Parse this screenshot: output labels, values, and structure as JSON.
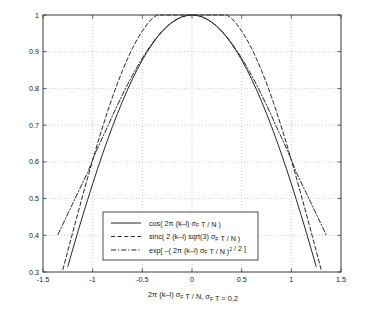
{
  "chart_data": {
    "type": "line",
    "title": "",
    "xlabel": "2π (k–l) σ_F T / N,   σ_F T = 0.2",
    "ylabel": "",
    "xlim": [
      -1.5,
      1.5
    ],
    "ylim": [
      0.3,
      1.0
    ],
    "xticks": [
      -1.5,
      -1,
      -0.5,
      0,
      0.5,
      1,
      1.5
    ],
    "xticklabels": [
      "-1.5",
      "-1",
      "-0.5",
      "0",
      "0.5",
      "1",
      "1.5"
    ],
    "yticks": [
      0.3,
      0.4,
      0.5,
      0.6,
      0.7,
      0.8,
      0.9,
      1.0
    ],
    "yticklabels": [
      "0.3",
      "0.4",
      "0.5",
      "0.6",
      "0.7",
      "0.8",
      "0.9",
      "1"
    ],
    "grid": true,
    "grid_style": "dotted",
    "grid_color": "#b4b4b4",
    "legend_position": "lower center",
    "line_color": "#1a1a1a",
    "series": [
      {
        "name": "cos( 2π (k–l) σ_F T / N )",
        "style": "solid",
        "x": [
          -1.25,
          -1.2,
          -1.15,
          -1.1,
          -1.05,
          -1.0,
          -0.95,
          -0.9,
          -0.85,
          -0.8,
          -0.75,
          -0.7,
          -0.65,
          -0.6,
          -0.55,
          -0.5,
          -0.45,
          -0.4,
          -0.35,
          -0.3,
          -0.25,
          -0.2,
          -0.15,
          -0.1,
          -0.05,
          0,
          0.05,
          0.1,
          0.15,
          0.2,
          0.25,
          0.3,
          0.35,
          0.4,
          0.45,
          0.5,
          0.55,
          0.6,
          0.65,
          0.7,
          0.75,
          0.8,
          0.85,
          0.9,
          0.95,
          1.0,
          1.05,
          1.1,
          1.15,
          1.2,
          1.25
        ],
        "y": [
          0.3153,
          0.3624,
          0.4085,
          0.4536,
          0.4976,
          0.5403,
          0.5817,
          0.6216,
          0.66,
          0.6967,
          0.7317,
          0.7648,
          0.7961,
          0.8253,
          0.8525,
          0.8776,
          0.9004,
          0.9211,
          0.9394,
          0.9553,
          0.9689,
          0.9801,
          0.9888,
          0.995,
          0.9988,
          1.0,
          0.9988,
          0.995,
          0.9888,
          0.9801,
          0.9689,
          0.9553,
          0.9394,
          0.9211,
          0.9004,
          0.8776,
          0.8525,
          0.8253,
          0.7961,
          0.7648,
          0.7317,
          0.6967,
          0.66,
          0.6216,
          0.5817,
          0.5403,
          0.4976,
          0.4536,
          0.4085,
          0.3624,
          0.3153
        ]
      },
      {
        "name": "sinc( 2 (k–l) sqrt(3) σ_F T / N )",
        "style": "dashed",
        "x": [
          -1.3,
          -1.25,
          -1.2,
          -1.15,
          -1.1,
          -1.05,
          -1.0,
          -0.95,
          -0.9,
          -0.85,
          -0.8,
          -0.75,
          -0.7,
          -0.65,
          -0.6,
          -0.55,
          -0.5,
          -0.45,
          -0.4,
          -0.35,
          -0.3,
          -0.25,
          -0.2,
          -0.15,
          -0.1,
          -0.05,
          0,
          0.05,
          0.1,
          0.15,
          0.2,
          0.25,
          0.3,
          0.35,
          0.4,
          0.45,
          0.5,
          0.55,
          0.6,
          0.65,
          0.7,
          0.75,
          0.8,
          0.85,
          0.9,
          0.95,
          1.0,
          1.05,
          1.1,
          1.15,
          1.2,
          1.25,
          1.3
        ],
        "y": [
          0.3067,
          0.3575,
          0.4083,
          0.4588,
          0.5086,
          0.5574,
          0.605,
          0.651,
          0.6952,
          0.7373,
          0.777,
          0.8143,
          0.8488,
          0.8804,
          0.909,
          0.9344,
          0.9565,
          0.9753,
          0.9905,
          1.0,
          1.0,
          1.0,
          1.0,
          1.0,
          1.0,
          1.0,
          1.0,
          1.0,
          1.0,
          1.0,
          1.0,
          1.0,
          1.0,
          1.0,
          0.9905,
          0.9753,
          0.9565,
          0.9344,
          0.909,
          0.8804,
          0.8488,
          0.8143,
          0.777,
          0.7373,
          0.6952,
          0.651,
          0.605,
          0.5574,
          0.5086,
          0.4588,
          0.4083,
          0.3575,
          0.3067
        ]
      },
      {
        "name": "exp[ –( 2π (k–l) σ_F T / N )² / 2 ]",
        "style": "dashdot",
        "x": [
          -1.35,
          -1.3,
          -1.25,
          -1.2,
          -1.15,
          -1.1,
          -1.05,
          -1.0,
          -0.95,
          -0.9,
          -0.85,
          -0.8,
          -0.75,
          -0.7,
          -0.65,
          -0.6,
          -0.55,
          -0.5,
          -0.45,
          -0.4,
          -0.35,
          -0.3,
          -0.25,
          -0.2,
          -0.15,
          -0.1,
          -0.05,
          0,
          0.05,
          0.1,
          0.15,
          0.2,
          0.25,
          0.3,
          0.35,
          0.4,
          0.45,
          0.5,
          0.55,
          0.6,
          0.65,
          0.7,
          0.75,
          0.8,
          0.85,
          0.9,
          0.95,
          1.0,
          1.05,
          1.1,
          1.15,
          1.2,
          1.25,
          1.3,
          1.35
        ],
        "y": [
          0.402,
          0.43,
          0.4584,
          0.4868,
          0.5153,
          0.5434,
          0.5712,
          0.6065,
          0.6376,
          0.667,
          0.6956,
          0.7261,
          0.7548,
          0.7827,
          0.81,
          0.8353,
          0.8597,
          0.8825,
          0.9037,
          0.9231,
          0.9406,
          0.956,
          0.9692,
          0.9802,
          0.9888,
          0.995,
          0.9988,
          1.0,
          0.9988,
          0.995,
          0.9888,
          0.9802,
          0.9692,
          0.956,
          0.9406,
          0.9231,
          0.9037,
          0.8825,
          0.8597,
          0.8353,
          0.81,
          0.7827,
          0.7548,
          0.7261,
          0.6956,
          0.667,
          0.6376,
          0.6065,
          0.5712,
          0.5434,
          0.5153,
          0.4868,
          0.4584,
          0.43,
          0.402
        ]
      }
    ]
  },
  "legend": {
    "entries": [
      {
        "style": "solid",
        "parts": [
          {
            "t": "cos( 2π (k–l) σ",
            "k": "n"
          },
          {
            "t": "F",
            "k": "sub"
          },
          {
            "t": " T / N )",
            "k": "n"
          }
        ]
      },
      {
        "style": "dashed",
        "parts": [
          {
            "t": "sinc( 2 (k–l) sqrt(3) σ",
            "k": "n"
          },
          {
            "t": "F",
            "k": "sub"
          },
          {
            "t": " T / N )",
            "k": "n"
          }
        ]
      },
      {
        "style": "dashdot",
        "parts": [
          {
            "t": "exp[ –( 2π (k–l) σ",
            "k": "n"
          },
          {
            "t": "F",
            "k": "sub"
          },
          {
            "t": " T / N )",
            "k": "n"
          },
          {
            "t": "2",
            "k": "sup"
          },
          {
            "t": " / 2 ]",
            "k": "n"
          }
        ]
      }
    ]
  },
  "xaxis_title": {
    "parts": [
      {
        "t": "2π (k–l) σ",
        "k": "n"
      },
      {
        "t": "F",
        "k": "sub"
      },
      {
        "t": " T / N,   σ",
        "k": "n"
      },
      {
        "t": "F",
        "k": "sub"
      },
      {
        "t": " T = 0.2",
        "k": "n"
      }
    ]
  }
}
